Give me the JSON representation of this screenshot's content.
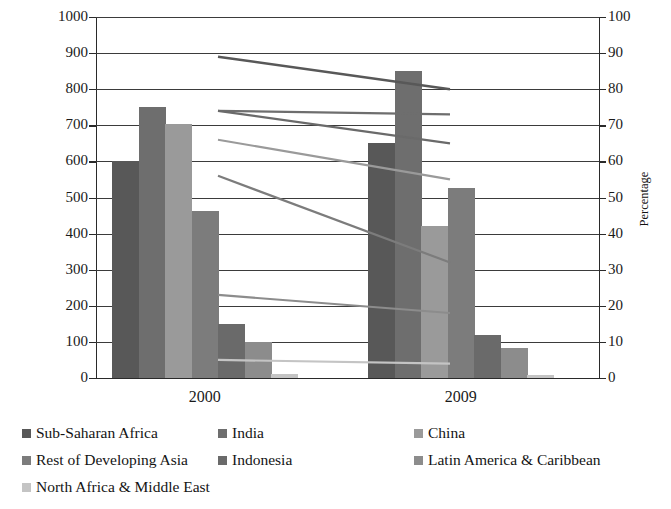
{
  "chart_data": {
    "type": "bar",
    "title": "",
    "categories": [
      "2000",
      "2009"
    ],
    "ylabel": "Population in Millions Dependent on Biomass",
    "ylabel_secondary": "Percentage",
    "xlabel": "",
    "ylim": [
      0,
      1000
    ],
    "ylim_secondary": [
      0,
      100
    ],
    "ytick_labels": [
      "1000",
      "900",
      "800",
      "700",
      "600",
      "500",
      "400",
      "300",
      "200",
      "100",
      "0"
    ],
    "ytick_values": [
      1000,
      900,
      800,
      700,
      600,
      500,
      400,
      300,
      200,
      100,
      0
    ],
    "ytick_labels_secondary": [
      "100",
      "90",
      "80",
      "70",
      "60",
      "50",
      "40",
      "30",
      "20",
      "10",
      "0"
    ],
    "ytick_values_secondary": [
      100,
      90,
      80,
      70,
      60,
      50,
      40,
      30,
      20,
      10,
      0
    ],
    "grid": true,
    "legend_position": "bottom",
    "series": [
      {
        "name": "Sub-Saharan Africa",
        "color": "#585858",
        "values": [
          600,
          650
        ],
        "percentages": [
          89,
          80
        ]
      },
      {
        "name": "India",
        "color": "#6e6e6e",
        "values": [
          750,
          850
        ],
        "percentages": [
          74,
          73
        ]
      },
      {
        "name": "China",
        "color": "#9a9a9a",
        "values": [
          705,
          420
        ],
        "percentages": [
          66,
          55
        ]
      },
      {
        "name": "Rest of Developing Asia",
        "color": "#7c7c7c",
        "values": [
          462,
          525
        ],
        "percentages": [
          56,
          32
        ]
      },
      {
        "name": "Indonesia",
        "color": "#6a6a6a",
        "values": [
          150,
          120
        ],
        "percentages": [
          74,
          65
        ]
      },
      {
        "name": "Latin America & Caribbean",
        "color": "#8c8c8c",
        "values": [
          100,
          82
        ],
        "percentages": [
          23,
          18
        ]
      },
      {
        "name": "North Africa & Middle East",
        "color": "#c4c4c4",
        "values": [
          12,
          8
        ],
        "percentages": [
          5,
          4
        ]
      }
    ]
  },
  "axes": {
    "left_title": "Population in Millions Dependent on Biomass",
    "right_title": "Percentage"
  },
  "legend": {
    "items": [
      {
        "label": "Sub-Saharan Africa",
        "color": "#585858"
      },
      {
        "label": "India",
        "color": "#6e6e6e"
      },
      {
        "label": "China",
        "color": "#9a9a9a"
      },
      {
        "label": "Rest of Developing Asia",
        "color": "#7c7c7c"
      },
      {
        "label": "Indonesia",
        "color": "#6a6a6a"
      },
      {
        "label": "Latin America & Caribbean",
        "color": "#8c8c8c"
      },
      {
        "label": "North Africa & Middle East",
        "color": "#c4c4c4"
      }
    ]
  }
}
